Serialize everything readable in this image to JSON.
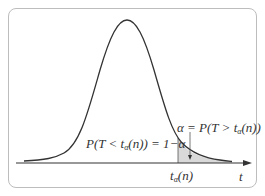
{
  "diagram": {
    "type": "t-distribution upper quantile",
    "axis_label": "t",
    "quantile_label": {
      "base": "t",
      "sub": "α",
      "rest": "(n)"
    },
    "left_area_label": {
      "prefix": "P(T < t",
      "sub": "α",
      "suffix": "(n)) = 1−α"
    },
    "right_area_label": {
      "prefix": "α = P(T > t",
      "sub": "α",
      "suffix": "(n))"
    },
    "colors": {
      "curve": "#333333",
      "shade": "#d9d9d9",
      "frame": "#bdbdbd",
      "axis": "#333333"
    }
  }
}
